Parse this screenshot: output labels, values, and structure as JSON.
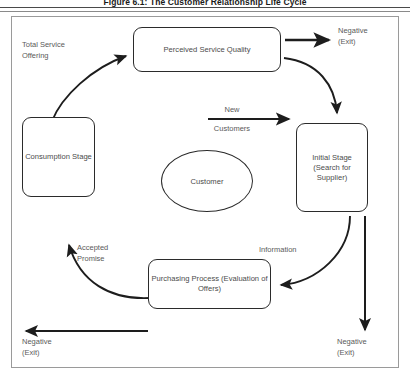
{
  "figure": {
    "title": "Figure 6.1: The Customer Relationship Life Cycle",
    "stroke_color": "#2b2b2b",
    "text_color": "#4b4b4b",
    "label_color": "#5a5a5a",
    "frame_color": "#9a9a9a",
    "background": "#ffffff"
  },
  "nodes": {
    "perceived_service_quality": {
      "label": "Perceived Service Quality",
      "shape": "rounded-rect"
    },
    "consumption_stage": {
      "label": "Consumption\nStage",
      "shape": "rounded-rect"
    },
    "initial_stage": {
      "label": "Initial Stage\n(Search for\nSupplier)",
      "shape": "rounded-rect"
    },
    "purchasing_process": {
      "label": "Purchasing Process\n(Evaluation of Offers)",
      "shape": "rounded-rect"
    },
    "customer": {
      "label": "Customer",
      "shape": "ellipse"
    }
  },
  "edge_labels": {
    "total_service_offering": "Total Service\nOffering",
    "new": "New",
    "customers": "Customers",
    "information": "Information",
    "accepted_promise": "Accepted\nPromise"
  },
  "exit_labels": {
    "top_right": "Negative\n(Exit)",
    "bottom_right": "Negative\n(Exit)",
    "bottom_left": "Negative\n(Exit)"
  },
  "edges": [
    {
      "from": "consumption_stage",
      "to": "perceived_service_quality",
      "label": "Total Service\nOffering",
      "style": "curved"
    },
    {
      "from": "perceived_service_quality",
      "to": "exit_top_right",
      "label": "",
      "style": "straight"
    },
    {
      "from": "perceived_service_quality",
      "to": "initial_stage",
      "label": "",
      "style": "curved"
    },
    {
      "from": "customer",
      "to": "initial_stage",
      "label": "New Customers",
      "style": "straight"
    },
    {
      "from": "initial_stage",
      "to": "purchasing_process",
      "label": "Information",
      "style": "curved"
    },
    {
      "from": "initial_stage",
      "to": "exit_bottom_right",
      "label": "",
      "style": "straight"
    },
    {
      "from": "purchasing_process",
      "to": "consumption_stage",
      "label": "Accepted\nPromise",
      "style": "curved"
    },
    {
      "from": "purchasing_process",
      "to": "exit_bottom_left",
      "label": "",
      "style": "straight"
    }
  ]
}
